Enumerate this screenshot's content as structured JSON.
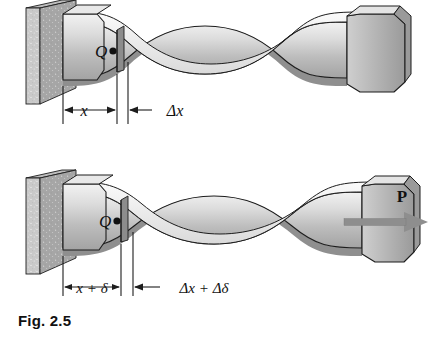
{
  "figure": {
    "caption": "Fig. 2.5"
  },
  "panels": [
    {
      "id": "undeformed",
      "point_label": "Q",
      "dim_left": "x",
      "dim_right": "Δx",
      "force_label": ""
    },
    {
      "id": "deformed",
      "point_label": "Q",
      "dim_left": "x + δ",
      "dim_right": "Δx + Δδ",
      "force_label": "P"
    }
  ],
  "colors": {
    "wall_light": "#d6d6d6",
    "wall_dark": "#9a9a9a",
    "bar_light": "#e2e2e2",
    "bar_mid": "#c2c2c2",
    "bar_dark": "#9d9d9d",
    "outline": "#1d1d1d",
    "slice": "#8a8a8a",
    "arrow": "#8e8e8e",
    "text": "#111111",
    "background": "#ffffff"
  }
}
